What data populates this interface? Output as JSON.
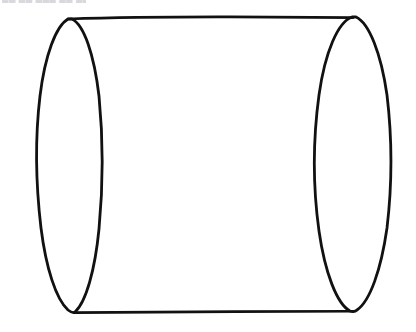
{
  "figure": {
    "background_color": "#ffffff",
    "ink_color": "#111111",
    "canvas": {
      "width": 416,
      "height": 332
    },
    "parts": {
      "left_ellipse": {
        "name": "left-end-cap-ellipse",
        "center_x": 70,
        "center_y": 166,
        "radius_x": 31,
        "radius_y": 146,
        "rotation_deg": -1,
        "stroke_width": 2.6
      },
      "right_ellipse": {
        "name": "right-end-cap-ellipse",
        "center_x": 352,
        "center_y": 165,
        "radius_x": 38,
        "radius_y": 148,
        "rotation_deg": 1,
        "stroke_width": 2.6
      },
      "top_line": {
        "name": "top-side-line",
        "x1": 68,
        "y1": 19,
        "x2": 353,
        "y2": 17,
        "stroke_width": 2.4
      },
      "bottom_line": {
        "name": "bottom-side-line",
        "x1": 74,
        "y1": 313,
        "x2": 353,
        "y2": 311,
        "stroke_width": 2.4
      }
    },
    "scan_artifact": {
      "name": "cropped-text-sliver",
      "text": "█▄ ▄█ ▄█▄ █▄ ▄██",
      "note": "faint unreadable bottom edge of a cropped text line at the very top-left of the scan"
    }
  }
}
